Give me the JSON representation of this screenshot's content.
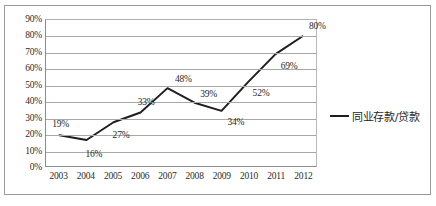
{
  "chart_data": {
    "type": "line",
    "title": "",
    "xlabel": "",
    "ylabel": "",
    "categories": [
      "2003",
      "2004",
      "2005",
      "2006",
      "2007",
      "2008",
      "2009",
      "2010",
      "2011",
      "2012"
    ],
    "values": [
      19,
      16,
      27,
      33,
      48,
      39,
      34,
      52,
      69,
      80
    ],
    "point_labels": [
      "19%",
      "16%",
      "27%",
      "33%",
      "48%",
      "39%",
      "34%",
      "52%",
      "69%",
      "80%"
    ],
    "ylim": [
      0,
      90
    ],
    "ytick_labels": [
      "90%",
      "80%",
      "70%",
      "60%",
      "50%",
      "40%",
      "30%",
      "20%",
      "10%",
      "0%"
    ],
    "yticks": [
      90,
      80,
      70,
      60,
      50,
      40,
      30,
      20,
      10,
      0
    ],
    "grid": true,
    "legend_position": "right",
    "series": [
      {
        "name": "同业存款/贷款",
        "color": "#1f1f1f",
        "values": [
          19,
          16,
          27,
          33,
          48,
          39,
          34,
          52,
          69,
          80
        ]
      }
    ]
  },
  "legend": {
    "entries": [
      {
        "label": "同业存款/贷款",
        "marker": "line-marker"
      }
    ]
  }
}
